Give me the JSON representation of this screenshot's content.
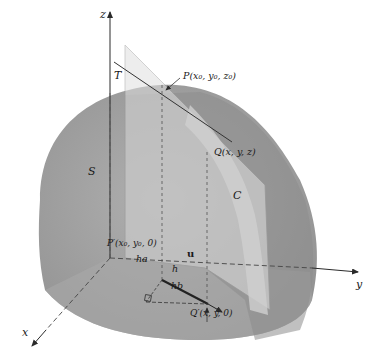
{
  "diagram": {
    "type": "3d-surface-directional-derivative",
    "colors": {
      "background": "#ffffff",
      "surface": "#a3a3a3",
      "surface_dark": "#8f8f8f",
      "floor": "#b3b3b3",
      "plane": "#d2d2d2",
      "plane_edge": "#9a9a9a",
      "axis": "#2a2a2a",
      "line": "#333333"
    },
    "axes": {
      "x": "x",
      "y": "y",
      "z": "z"
    },
    "labels": {
      "surface": "S",
      "tangent_line": "T",
      "curve": "C",
      "point_P": "P(x₀, y₀, z₀)",
      "point_Q": "Q(x, y, z)",
      "point_P_prime": "P′(x₀, y₀, 0)",
      "point_Q_prime": "Q′(x, y, 0)",
      "unit_vector": "u",
      "h": "h",
      "ha": "ha",
      "hb": "hb"
    }
  }
}
